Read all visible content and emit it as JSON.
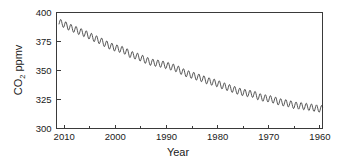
{
  "chart_data": {
    "type": "line",
    "title": "",
    "subtitle": "",
    "xlabel": "Year",
    "ylabel": "CO2 ppmv",
    "ylabel_parts": {
      "prefix": "CO",
      "subscript": "2",
      "suffix": " ppmv"
    },
    "xlim": [
      2011.5,
      1959.5
    ],
    "ylim": [
      300,
      400
    ],
    "x_axis_reversed": true,
    "grid": false,
    "legend": null,
    "x_ticks": [
      2010,
      2000,
      1990,
      1980,
      1970,
      1960
    ],
    "x_tick_labels": [
      "2010",
      "2000",
      "1990",
      "1980",
      "1970",
      "1960"
    ],
    "x_minor_ticks": [
      2005,
      1995,
      1985,
      1975,
      1965
    ],
    "y_ticks": [
      300,
      325,
      350,
      375,
      400
    ],
    "y_tick_labels": [
      "300",
      "325",
      "350",
      "375",
      "400"
    ],
    "series": [
      {
        "name": "Atmospheric CO2 (monthly mean)",
        "color": "#2b2b2b",
        "description": "Monthly mean CO2 concentration with annual seasonal sawtooth, plotted on a reversed time axis from 2011 back to 1960",
        "seasonal_amplitude_ppmv": 6.0,
        "annual_means": [
          {
            "year": 2011,
            "value": 391.6
          },
          {
            "year": 2010,
            "value": 389.8
          },
          {
            "year": 2009,
            "value": 387.4
          },
          {
            "year": 2008,
            "value": 385.6
          },
          {
            "year": 2007,
            "value": 383.7
          },
          {
            "year": 2006,
            "value": 381.9
          },
          {
            "year": 2005,
            "value": 379.8
          },
          {
            "year": 2004,
            "value": 377.5
          },
          {
            "year": 2003,
            "value": 375.8
          },
          {
            "year": 2002,
            "value": 373.2
          },
          {
            "year": 2001,
            "value": 371.1
          },
          {
            "year": 2000,
            "value": 369.5
          },
          {
            "year": 1999,
            "value": 368.4
          },
          {
            "year": 1998,
            "value": 366.7
          },
          {
            "year": 1997,
            "value": 363.7
          },
          {
            "year": 1996,
            "value": 362.6
          },
          {
            "year": 1995,
            "value": 360.8
          },
          {
            "year": 1994,
            "value": 358.8
          },
          {
            "year": 1993,
            "value": 357.1
          },
          {
            "year": 1992,
            "value": 356.4
          },
          {
            "year": 1991,
            "value": 355.6
          },
          {
            "year": 1990,
            "value": 354.4
          },
          {
            "year": 1989,
            "value": 353.1
          },
          {
            "year": 1988,
            "value": 351.6
          },
          {
            "year": 1987,
            "value": 349.2
          },
          {
            "year": 1986,
            "value": 347.2
          },
          {
            "year": 1985,
            "value": 346.0
          },
          {
            "year": 1984,
            "value": 344.4
          },
          {
            "year": 1983,
            "value": 343.1
          },
          {
            "year": 1982,
            "value": 341.1
          },
          {
            "year": 1981,
            "value": 340.1
          },
          {
            "year": 1980,
            "value": 338.7
          },
          {
            "year": 1979,
            "value": 336.8
          },
          {
            "year": 1978,
            "value": 335.4
          },
          {
            "year": 1977,
            "value": 333.8
          },
          {
            "year": 1976,
            "value": 332.2
          },
          {
            "year": 1975,
            "value": 331.1
          },
          {
            "year": 1974,
            "value": 330.2
          },
          {
            "year": 1973,
            "value": 329.7
          },
          {
            "year": 1972,
            "value": 327.4
          },
          {
            "year": 1971,
            "value": 326.3
          },
          {
            "year": 1970,
            "value": 325.7
          },
          {
            "year": 1969,
            "value": 324.6
          },
          {
            "year": 1968,
            "value": 323.0
          },
          {
            "year": 1967,
            "value": 322.2
          },
          {
            "year": 1966,
            "value": 321.4
          },
          {
            "year": 1965,
            "value": 320.0
          },
          {
            "year": 1964,
            "value": 319.6
          },
          {
            "year": 1963,
            "value": 319.0
          },
          {
            "year": 1962,
            "value": 318.4
          },
          {
            "year": 1961,
            "value": 317.6
          },
          {
            "year": 1960,
            "value": 316.9
          }
        ]
      }
    ]
  }
}
